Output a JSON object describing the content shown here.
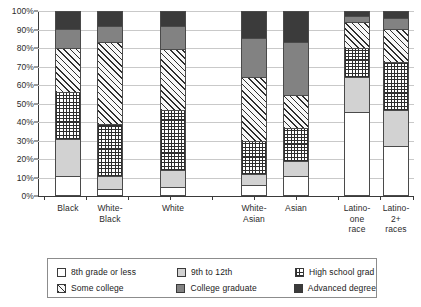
{
  "chart_data": {
    "type": "bar",
    "subtype": "stacked-100-percent",
    "title": "",
    "xlabel": "",
    "ylabel": "",
    "ylim": [
      0,
      100
    ],
    "ytick_labels": [
      "0%",
      "10%",
      "20%",
      "30%",
      "40%",
      "50%",
      "60%",
      "70%",
      "80%",
      "90%",
      "100%"
    ],
    "ytick_values": [
      0,
      10,
      20,
      30,
      40,
      50,
      60,
      70,
      80,
      90,
      100
    ],
    "grid": true,
    "legend_position": "bottom",
    "categories": [
      "Black",
      "White-Black",
      "White",
      "White-Asian",
      "Asian",
      "Latino-one race",
      "Latino-2+ races"
    ],
    "category_label_lines": [
      [
        "Black"
      ],
      [
        "White-",
        "Black"
      ],
      [
        "White"
      ],
      [
        "White-",
        "Asian"
      ],
      [
        "Asian"
      ],
      [
        "Latino-",
        "one",
        "race"
      ],
      [
        "Latino-",
        "2+",
        "races"
      ]
    ],
    "series": [
      {
        "name": "8th grade or less",
        "fill": "white",
        "values": [
          10,
          3,
          4,
          5,
          10,
          45,
          26
        ]
      },
      {
        "name": "9th to 12th",
        "fill": "light-gray",
        "values": [
          20,
          7,
          9,
          6,
          8,
          19,
          20
        ]
      },
      {
        "name": "High school grad",
        "fill": "grid-pattern",
        "values": [
          26,
          28,
          33,
          18,
          18,
          16,
          26
        ]
      },
      {
        "name": "Some college",
        "fill": "hatch",
        "values": [
          24,
          45,
          33,
          35,
          18,
          14,
          18
        ]
      },
      {
        "name": "College graduate",
        "fill": "medium-gray",
        "values": [
          10,
          9,
          13,
          21,
          29,
          3,
          6
        ]
      },
      {
        "name": "Advanced degree",
        "fill": "dark-gray",
        "values": [
          10,
          8,
          8,
          15,
          17,
          3,
          4
        ]
      }
    ]
  },
  "legend": {
    "items": [
      {
        "label": "8th grade or less",
        "fill": "white"
      },
      {
        "label": "9th to 12th",
        "fill": "light-gray"
      },
      {
        "label": "High school grad",
        "fill": "grid-pattern"
      },
      {
        "label": "Some college",
        "fill": "hatch"
      },
      {
        "label": "College graduate",
        "fill": "medium-gray"
      },
      {
        "label": "Advanced degree",
        "fill": "dark-gray"
      }
    ]
  },
  "colors": {
    "axis": "#3a3a3a",
    "gridline": "#c9c9c9",
    "light_gray": "#d2d2d2",
    "medium_gray": "#828282",
    "dark_gray": "#3b3b3b",
    "pattern_ink": "#2e2e2e"
  }
}
